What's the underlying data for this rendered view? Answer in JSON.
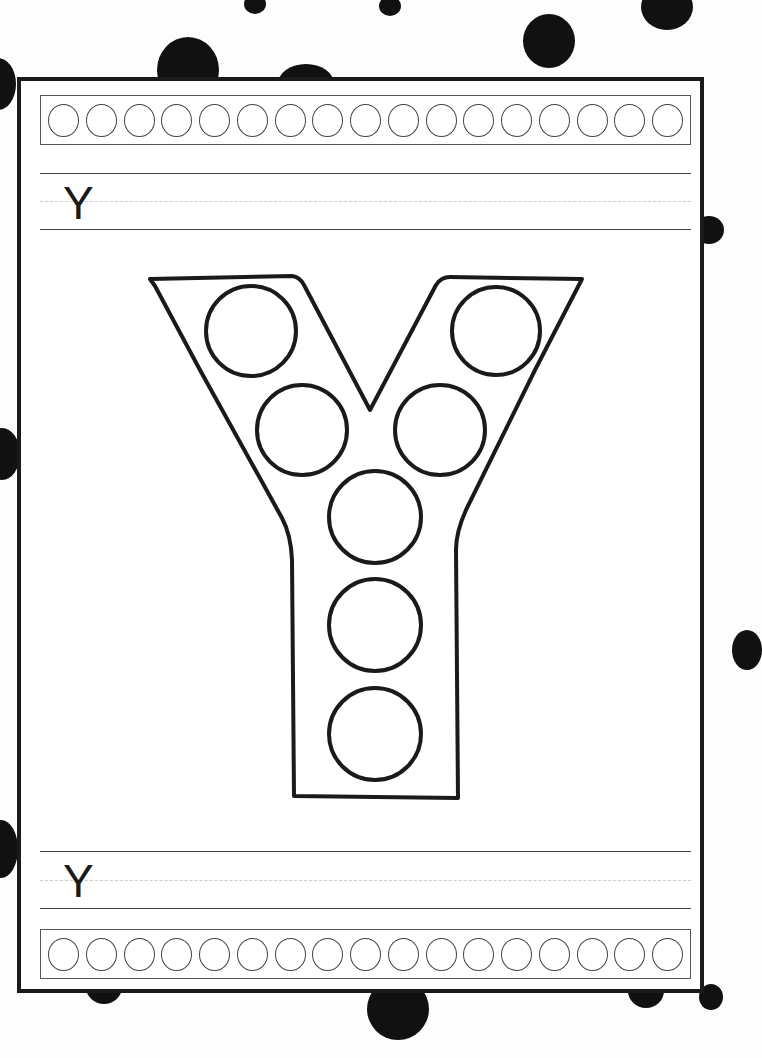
{
  "worksheet": {
    "title_letter_top": "Y",
    "title_letter_bottom": "Y",
    "top_strip_circle_count": 17,
    "bottom_strip_circle_count": 17,
    "big_letter": "Y",
    "big_letter_dot_count": 7,
    "colors": {
      "ink": "#1a1a1a",
      "paper": "#ffffff",
      "guide_dashed": "#cccccc"
    }
  }
}
